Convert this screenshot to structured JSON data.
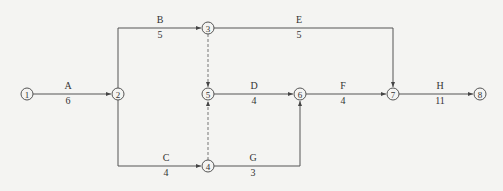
{
  "diagram": {
    "type": "activity-on-arrow network",
    "nodes": [
      {
        "id": "1",
        "x": 27,
        "y": 94
      },
      {
        "id": "2",
        "x": 118,
        "y": 94
      },
      {
        "id": "3",
        "x": 208,
        "y": 28
      },
      {
        "id": "4",
        "x": 208,
        "y": 166
      },
      {
        "id": "5",
        "x": 208,
        "y": 94
      },
      {
        "id": "6",
        "x": 300,
        "y": 94
      },
      {
        "id": "7",
        "x": 393,
        "y": 94
      },
      {
        "id": "8",
        "x": 480,
        "y": 94
      }
    ],
    "activities": [
      {
        "name": "A",
        "duration": "6",
        "from": "1",
        "to": "2"
      },
      {
        "name": "B",
        "duration": "5",
        "from": "2",
        "to": "3"
      },
      {
        "name": "C",
        "duration": "4",
        "from": "2",
        "to": "4"
      },
      {
        "name": "D",
        "duration": "4",
        "from": "5",
        "to": "6"
      },
      {
        "name": "E",
        "duration": "5",
        "from": "3",
        "to": "7"
      },
      {
        "name": "F",
        "duration": "4",
        "from": "6",
        "to": "7"
      },
      {
        "name": "G",
        "duration": "3",
        "from": "4",
        "to": "6"
      },
      {
        "name": "H",
        "duration": "11",
        "from": "7",
        "to": "8"
      }
    ],
    "dummies": [
      {
        "from": "3",
        "to": "5"
      },
      {
        "from": "4",
        "to": "5"
      }
    ],
    "colors": {
      "line": "#555555",
      "dummy": "#777777",
      "background": "#f4f4f2"
    }
  }
}
